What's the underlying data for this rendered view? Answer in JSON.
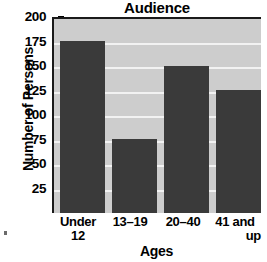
{
  "chart_data": {
    "type": "bar",
    "title": "Audience",
    "xlabel": "Ages",
    "ylabel": "Number of Persons",
    "categories": [
      "Under 12",
      "13–19",
      "20–40",
      "41 and up"
    ],
    "category_lines": [
      [
        "Under",
        "12"
      ],
      [
        "13–19",
        ""
      ],
      [
        "20–40",
        ""
      ],
      [
        "41 and",
        "up"
      ]
    ],
    "values": [
      175,
      75,
      150,
      125
    ],
    "ylim": [
      0,
      200
    ],
    "ytick_labels": [
      "200",
      "175",
      "150",
      "125",
      "100",
      "75",
      "50",
      "25"
    ],
    "ytick_values": [
      200,
      175,
      150,
      125,
      100,
      75,
      50,
      25
    ],
    "grid": true,
    "legend": "none",
    "colors": {
      "bar": "#3a3a3a",
      "plot_background": "#cdcdcd",
      "gridline": "#f2f2f2",
      "axis": "#1a1a1a",
      "text": "#000000",
      "page_background": "#ffffff"
    }
  }
}
